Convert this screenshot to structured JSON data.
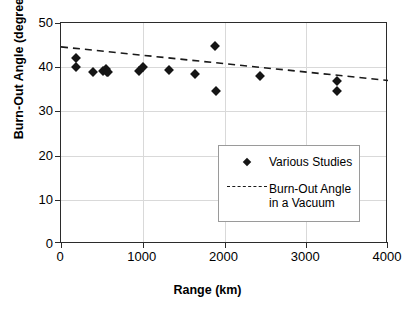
{
  "chart_data": {
    "type": "scatter",
    "title": "",
    "xlabel": "Range (km)",
    "ylabel": "Burn-Out Angle (degrees)",
    "xlim": [
      0,
      4000
    ],
    "ylim": [
      0,
      50
    ],
    "xticks": [
      0,
      1000,
      2000,
      3000,
      4000
    ],
    "yticks": [
      0,
      10,
      20,
      30,
      40,
      50
    ],
    "xtick_labels": [
      "0",
      "1000",
      "2000",
      "3000",
      "4000"
    ],
    "ytick_labels": [
      "0",
      "10",
      "20",
      "30",
      "40",
      "50"
    ],
    "grid": "horizontal-and-vertical-light",
    "legend_position": "center-right-inside",
    "series": [
      {
        "name": "Various Studies",
        "type": "scatter",
        "marker": "diamond",
        "color": "#151515",
        "points": [
          {
            "x": 180,
            "y": 42.0
          },
          {
            "x": 180,
            "y": 40.0
          },
          {
            "x": 390,
            "y": 39.0
          },
          {
            "x": 515,
            "y": 39.2
          },
          {
            "x": 545,
            "y": 39.6
          },
          {
            "x": 565,
            "y": 39.0
          },
          {
            "x": 580,
            "y": 38.9
          },
          {
            "x": 960,
            "y": 39.2
          },
          {
            "x": 1000,
            "y": 40.0
          },
          {
            "x": 1320,
            "y": 39.3
          },
          {
            "x": 1640,
            "y": 38.5
          },
          {
            "x": 1900,
            "y": 34.6
          },
          {
            "x": 1880,
            "y": 44.8
          },
          {
            "x": 2440,
            "y": 38.0
          },
          {
            "x": 3380,
            "y": 36.8
          },
          {
            "x": 3380,
            "y": 34.7
          }
        ]
      },
      {
        "name": "Burn-Out Angle in a Vacuum",
        "type": "line",
        "style": "dashed",
        "color": "#1a1a1a",
        "x": [
          0,
          4000
        ],
        "values": [
          44.6,
          37.0
        ]
      }
    ],
    "legend": [
      {
        "label": "Various Studies",
        "marker": "diamond"
      },
      {
        "label": "Burn-Out Angle",
        "label2": "in a Vacuum",
        "marker": "dashed-line"
      }
    ]
  },
  "legend_items": {
    "studies_label": "Various Studies",
    "vacuum_label_line1": "Burn-Out Angle",
    "vacuum_label_line2": "in a Vacuum"
  }
}
